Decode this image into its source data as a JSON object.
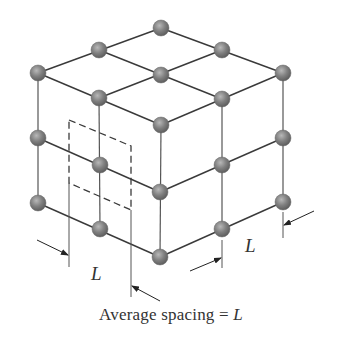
{
  "diagram": {
    "caption": {
      "text": "Average spacing = ",
      "variable": "L"
    },
    "dimension_labels": {
      "front_left": "L",
      "front_right": "L"
    },
    "colors": {
      "atom_fill": "#7d7d7d",
      "atom_highlight": "#b8b8b8",
      "bond_line": "#3a3a3a",
      "dashed_cell": "#3a3a3a",
      "text": "#333333"
    },
    "atoms": [
      {
        "id": "top-back",
        "x": 161,
        "y": 28
      },
      {
        "id": "top-left-back",
        "x": 99,
        "y": 50
      },
      {
        "id": "top-right-back",
        "x": 222,
        "y": 50
      },
      {
        "id": "top-left",
        "x": 38,
        "y": 73
      },
      {
        "id": "top-center",
        "x": 161,
        "y": 75
      },
      {
        "id": "top-right",
        "x": 283,
        "y": 73
      },
      {
        "id": "top-front-left",
        "x": 99,
        "y": 98
      },
      {
        "id": "top-front-right",
        "x": 222,
        "y": 99
      },
      {
        "id": "top-front",
        "x": 161,
        "y": 125
      },
      {
        "id": "mid-left",
        "x": 38,
        "y": 138
      },
      {
        "id": "mid-front-left",
        "x": 100,
        "y": 165
      },
      {
        "id": "mid-front",
        "x": 160,
        "y": 192
      },
      {
        "id": "mid-front-right",
        "x": 222,
        "y": 165
      },
      {
        "id": "mid-right",
        "x": 283,
        "y": 138
      },
      {
        "id": "bot-left",
        "x": 38,
        "y": 203
      },
      {
        "id": "bot-front-left",
        "x": 100,
        "y": 229
      },
      {
        "id": "bot-front",
        "x": 160,
        "y": 257
      },
      {
        "id": "bot-front-right",
        "x": 222,
        "y": 229
      },
      {
        "id": "bot-right",
        "x": 283,
        "y": 202
      }
    ]
  }
}
